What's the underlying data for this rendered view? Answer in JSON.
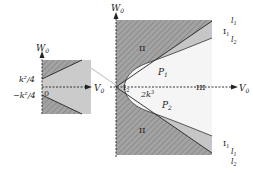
{
  "colors": {
    "hatch_region": "#9a9a9a",
    "hatch_stroke": "#7e7e7e",
    "light_region": "#c8c8c8",
    "region_III": "#f6f6f6",
    "axis": "#222222",
    "inset_bg": "#cfcfcf"
  },
  "main": {
    "y_axis_label": "W",
    "y_axis_sub": "0",
    "x_axis_label": "V",
    "x_axis_sub": "0",
    "region_II_top": "II",
    "region_II_bottom": "II",
    "region_III": "III",
    "region_I1_top": "I",
    "region_I1_top_sub": "1",
    "region_I1_bottom": "I",
    "region_I1_bottom_sub": "1",
    "region_I2": "I",
    "region_I2_sub": "2",
    "point_P1": "P",
    "point_P1_sub": "1",
    "point_P2": "P",
    "point_P2_sub": "2",
    "vertex_label": "2k",
    "vertex_label_sup": "3",
    "line_l1_top": "l",
    "line_l1_top_sub": "1",
    "line_l2_top": "l",
    "line_l2_top_sub": "2",
    "line_l1_bottom": "l",
    "line_l1_bottom_sub": "1",
    "line_l2_bottom": "l",
    "line_l2_bottom_sub": "2"
  },
  "inset": {
    "y_axis_label": "W",
    "y_axis_sub": "0",
    "x_axis_label": "V",
    "x_axis_sub": "0",
    "tick_upper": "k²/4",
    "tick_lower": "−k²/4",
    "origin_label": "0"
  }
}
